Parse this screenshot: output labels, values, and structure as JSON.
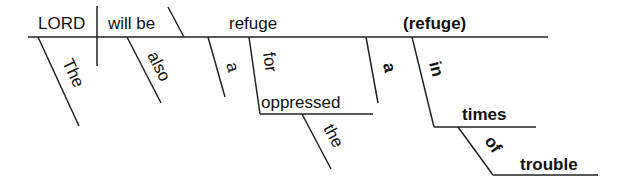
{
  "diagram": {
    "type": "sentence-diagram",
    "words": {
      "subject": "LORD",
      "verb": "will be",
      "predicate_noun": "refuge",
      "predicate_noun_appositive": "(refuge)",
      "mod_the": "The",
      "mod_also": "also",
      "mod_a1": "a",
      "prep_for": "for",
      "obj_oppressed": "oppressed",
      "mod_the2": "the",
      "mod_a2": "a",
      "prep_in": "in",
      "obj_times": "times",
      "prep_of": "of",
      "obj_trouble": "trouble"
    },
    "colors": {
      "line": "#222222",
      "text": "#111111",
      "background": "#ffffff"
    }
  }
}
